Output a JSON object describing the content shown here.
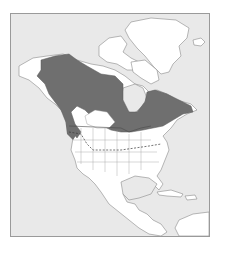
{
  "map": {
    "type": "species-range-map",
    "region": "North America",
    "colors": {
      "ocean": "#e9e9e9",
      "land": "#ffffff",
      "range": "#6f6f6f",
      "border": "#8a8a8a",
      "frame": "#9a9a9a"
    },
    "legend": [
      {
        "label": "",
        "meaning": "breeding/resident range",
        "color": "#6f6f6f"
      }
    ],
    "features": [
      "range-shaded",
      "state-province-borders",
      "dashed-southern-limit-line"
    ]
  }
}
